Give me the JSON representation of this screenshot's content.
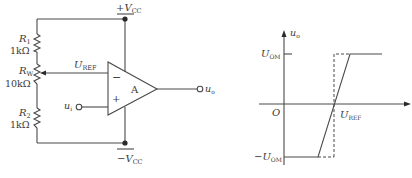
{
  "circuit": {
    "supply_pos": {
      "sign": "+",
      "symbol": "V",
      "sub": "CC"
    },
    "supply_neg": {
      "sign": "−",
      "symbol": "V",
      "sub": "CC"
    },
    "r1": {
      "name": "R",
      "sub": "1",
      "value": "1kΩ"
    },
    "rw": {
      "name": "R",
      "sub": "W",
      "value": "10kΩ"
    },
    "r2": {
      "name": "R",
      "sub": "2",
      "value": "1kΩ"
    },
    "uref": {
      "symbol": "U",
      "sub": "REF"
    },
    "opamp": {
      "label": "A",
      "inv": "−",
      "noninv": "+"
    },
    "input": {
      "symbol": "u",
      "sub": "i"
    },
    "output": {
      "symbol": "u",
      "sub": "o"
    }
  },
  "graph": {
    "y_axis": {
      "symbol": "u",
      "sub": "o"
    },
    "origin": "O",
    "uom_pos": {
      "symbol": "U",
      "sub": "OM"
    },
    "uom_neg": {
      "sign": "−",
      "symbol": "U",
      "sub": "OM"
    },
    "uref": {
      "symbol": "U",
      "sub": "REF"
    }
  }
}
